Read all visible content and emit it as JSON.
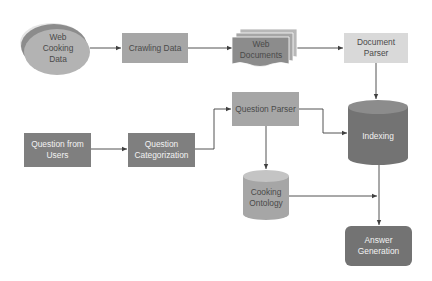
{
  "diagram": {
    "type": "flowchart",
    "nodes": {
      "web_cooking_data": {
        "line1": "Web",
        "line2": "Cooking",
        "line3": "Data",
        "shape": "stacked-ellipse"
      },
      "crawling_data": {
        "label": "Crawling Data",
        "shape": "rectangle"
      },
      "web_documents": {
        "line1": "Web",
        "line2": "Documents",
        "shape": "multi-document"
      },
      "document_parser": {
        "line1": "Document",
        "line2": "Parser",
        "shape": "rectangle"
      },
      "indexing": {
        "label": "Indexing",
        "shape": "cylinder"
      },
      "question_parser": {
        "label": "Question Parser",
        "shape": "rectangle"
      },
      "question_from_users": {
        "line1": "Question from",
        "line2": "Users",
        "shape": "rectangle"
      },
      "question_categorization": {
        "line1": "Question",
        "line2": "Categorization",
        "shape": "rectangle"
      },
      "cooking_ontology": {
        "line1": "Cooking",
        "line2": "Ontology",
        "shape": "cylinder"
      },
      "answer_generation": {
        "line1": "Answer",
        "line2": "Generation",
        "shape": "rounded-rectangle"
      }
    },
    "edges": [
      {
        "from": "Web Cooking Data",
        "to": "Crawling Data"
      },
      {
        "from": "Crawling Data",
        "to": "Web Documents"
      },
      {
        "from": "Web Documents",
        "to": "Document Parser"
      },
      {
        "from": "Document Parser",
        "to": "Indexing"
      },
      {
        "from": "Question from Users",
        "to": "Question Categorization"
      },
      {
        "from": "Question Categorization",
        "to": "Question Parser"
      },
      {
        "from": "Question Parser",
        "to": "Indexing"
      },
      {
        "from": "Question Parser",
        "to": "Cooking Ontology"
      },
      {
        "from": "Cooking Ontology",
        "to": "Answer Generation"
      },
      {
        "from": "Indexing",
        "to": "Answer Generation"
      }
    ],
    "colors": {
      "light_fill": "#d9d9d9",
      "medium_fill": "#a6a6a6",
      "dark_fill": "#7f7f7f",
      "darker_fill": "#737373",
      "ellipse_back": "#e6e6e6",
      "ellipse_mid": "#8c8c8c",
      "ellipse_front": "#b3b3b3",
      "connector": "#404040"
    }
  }
}
